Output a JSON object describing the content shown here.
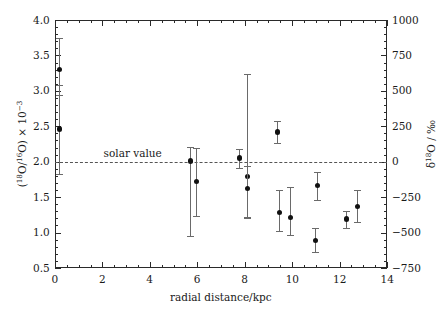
{
  "chart_data": {
    "type": "scatter",
    "title": "",
    "xlabel": "radial distance/kpc",
    "ylabel": "(18O/16O) × 10−3",
    "ylabel_right": "δ18O / ‰",
    "xlim": [
      0,
      14
    ],
    "ylim": [
      0.5,
      4.0
    ],
    "ylim_right": [
      -750,
      1000
    ],
    "grid": false,
    "legend": false,
    "x_ticks": [
      0,
      2,
      4,
      6,
      8,
      10,
      12,
      14
    ],
    "x_tick_labels": [
      "0",
      "2",
      "4",
      "6",
      "8",
      "10",
      "12",
      "14"
    ],
    "x_minor_step": 0.5,
    "y_ticks": [
      0.5,
      1.0,
      1.5,
      2.0,
      2.5,
      3.0,
      3.5,
      4.0
    ],
    "y_tick_labels": [
      "0.5",
      "1.0",
      "1.5",
      "2.0",
      "2.5",
      "3.0",
      "3.5",
      "4.0"
    ],
    "y_minor_step": 0.1,
    "y_right_ticks": [
      -750,
      -500,
      -250,
      0,
      250,
      500,
      750,
      1000
    ],
    "y_right_tick_labels": [
      "−750",
      "−500",
      "−250",
      "0",
      "250",
      "500",
      "750",
      "1000"
    ],
    "y_right_minor_step": 50,
    "reference_line": {
      "value": 2.0,
      "label": "solar value",
      "style": "dashed",
      "label_x": 2.05
    },
    "points": [
      {
        "x": 0.15,
        "y": 3.3,
        "yerr_low": 0.36,
        "yerr_high": 0.45
      },
      {
        "x": 0.15,
        "y": 2.46,
        "yerr_low": 0.63,
        "yerr_high": 0.62
      },
      {
        "x": 5.7,
        "y": 2.01,
        "yerr_low": 1.06,
        "yerr_high": 0.2
      },
      {
        "x": 5.95,
        "y": 1.72,
        "yerr_low": 0.49,
        "yerr_high": 0.48
      },
      {
        "x": 7.75,
        "y": 2.05,
        "yerr_low": 0.14,
        "yerr_high": 0.13
      },
      {
        "x": 8.1,
        "y": 1.79,
        "yerr_low": 0.58,
        "yerr_high": 1.45
      },
      {
        "x": 8.1,
        "y": 1.62,
        "yerr_low": 0.4,
        "yerr_high": 0.32
      },
      {
        "x": 9.35,
        "y": 2.42,
        "yerr_low": 0.16,
        "yerr_high": 0.16
      },
      {
        "x": 9.45,
        "y": 1.28,
        "yerr_low": 0.26,
        "yerr_high": 0.32
      },
      {
        "x": 9.9,
        "y": 1.21,
        "yerr_low": 0.24,
        "yerr_high": 0.44
      },
      {
        "x": 10.95,
        "y": 0.89,
        "yerr_low": 0.16,
        "yerr_high": 0.17
      },
      {
        "x": 11.05,
        "y": 1.66,
        "yerr_low": 0.2,
        "yerr_high": 0.19
      },
      {
        "x": 12.25,
        "y": 1.19,
        "yerr_low": 0.12,
        "yerr_high": 0.11
      },
      {
        "x": 12.75,
        "y": 1.37,
        "yerr_low": 0.22,
        "yerr_high": 0.23
      }
    ]
  }
}
